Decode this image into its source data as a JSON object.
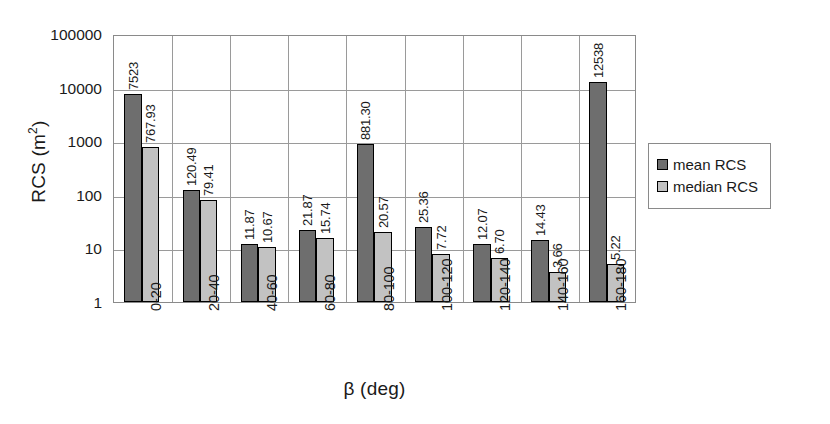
{
  "chart_data": {
    "type": "bar",
    "title": "",
    "xlabel": "β (deg)",
    "ylabel_text": "RCS (m",
    "ylabel_sup": "2",
    "ylabel_tail": ")",
    "yscale": "log",
    "ylim": [
      1,
      100000
    ],
    "ytick_labels": [
      "100000",
      "10000",
      "1000",
      "100",
      "10",
      "1"
    ],
    "ytick_values": [
      100000,
      10000,
      1000,
      100,
      10,
      1
    ],
    "grid": true,
    "legend_position": "right",
    "categories": [
      "0-20",
      "20-40",
      "40-60",
      "60-80",
      "80-100",
      "100-120",
      "120-140",
      "140-160",
      "160-180"
    ],
    "series": [
      {
        "name": "mean RCS",
        "color": "#6e6e6e",
        "values": [
          7523,
          120.49,
          11.87,
          21.87,
          881.3,
          25.36,
          12.07,
          14.43,
          12538
        ],
        "labels": [
          "7523",
          "120.49",
          "11.87",
          "21.87",
          "881.30",
          "25.36",
          "12.07",
          "14.43",
          "12538"
        ]
      },
      {
        "name": "median RCS",
        "color": "#c2c2c2",
        "values": [
          767.93,
          79.41,
          10.67,
          15.74,
          20.57,
          7.72,
          6.7,
          3.66,
          5.22
        ],
        "labels": [
          "767.93",
          "79.41",
          "10.67",
          "15.74",
          "20.57",
          "7.72",
          "6.70",
          "3.66",
          "5.22"
        ]
      }
    ]
  },
  "legend": {
    "items": [
      {
        "label": "mean RCS",
        "color": "#6e6e6e"
      },
      {
        "label": "median RCS",
        "color": "#c2c2c2"
      }
    ]
  }
}
